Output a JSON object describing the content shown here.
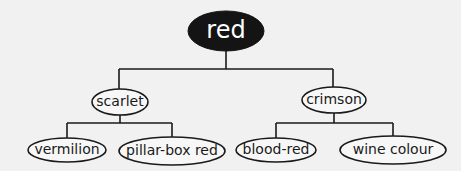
{
  "diagram": {
    "type": "tree",
    "root": {
      "label": "red",
      "style": "filled-black"
    },
    "level1": [
      {
        "label": "scarlet"
      },
      {
        "label": "crimson"
      }
    ],
    "level2": [
      {
        "label": "vermilion",
        "parent": "scarlet"
      },
      {
        "label": "pillar-box red",
        "parent": "scarlet"
      },
      {
        "label": "blood-red",
        "parent": "crimson"
      },
      {
        "label": "wine colour",
        "parent": "crimson"
      }
    ],
    "colors": {
      "background": "#f1f1f1",
      "line": "#1a1a1a",
      "root_fill": "#141414",
      "root_text": "#ffffff"
    }
  }
}
